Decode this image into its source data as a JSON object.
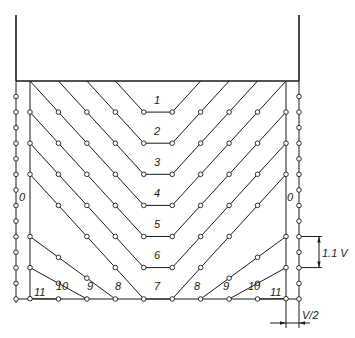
{
  "diagram": {
    "type": "layered-excavation-scheme",
    "colors": {
      "line": "#1a1a1a",
      "background": "#ffffff",
      "node_fill": "#ffffff"
    },
    "layer_labels": [
      "1",
      "2",
      "3",
      "4",
      "5",
      "6",
      "7",
      "8",
      "9",
      "10",
      "11"
    ],
    "side_labels": {
      "left": "0",
      "right": "0"
    },
    "bottom_left_labels": [
      "11",
      "10",
      "9",
      "8"
    ],
    "bottom_center_label": "7",
    "bottom_right_labels": [
      "8",
      "9",
      "10",
      "11"
    ],
    "dimensions": {
      "vertical_spacing": "1.1 V",
      "horizontal_offset": "V/2"
    }
  }
}
